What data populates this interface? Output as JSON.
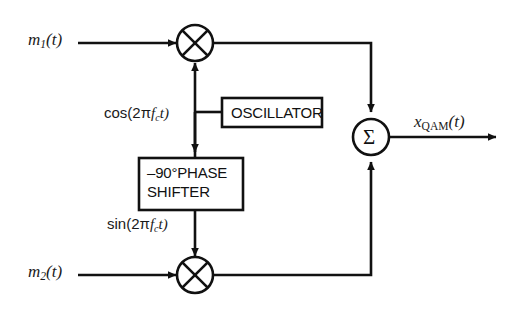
{
  "diagram": {
    "stroke_color": "#111111",
    "background_color": "#ffffff"
  },
  "inputs": [
    {
      "name": "m1",
      "label_base": "m",
      "label_sub": "1",
      "label_tail": "(t)"
    },
    {
      "name": "m2",
      "label_base": "m",
      "label_sub": "2",
      "label_tail": "(t)"
    }
  ],
  "carriers": {
    "cosine": {
      "prefix": "cos(2π",
      "var": "f",
      "sub": "c",
      "suffix": "t)"
    },
    "sine": {
      "prefix": "sin(2π",
      "var": "f",
      "sub": "c",
      "suffix": "t)"
    }
  },
  "blocks": [
    {
      "name": "oscillator",
      "label": "OSCILLATOR"
    },
    {
      "name": "phase-shifter",
      "label_line1": "–90°PHASE",
      "label_line2": "SHIFTER"
    }
  ],
  "operators": [
    {
      "name": "multiplier-upper",
      "symbol": "⊗"
    },
    {
      "name": "multiplier-lower",
      "symbol": "⊗"
    },
    {
      "name": "summer",
      "symbol": "Σ"
    }
  ],
  "output": {
    "name": "x-qam",
    "label_base": "x",
    "label_sub": "QAM",
    "label_tail": "(t)"
  }
}
